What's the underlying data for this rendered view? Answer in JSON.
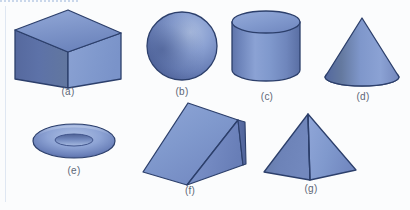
{
  "figure": {
    "background_color": "#fbfcfd",
    "outline_color": "#2c3f6b",
    "base_fill_color": "#7a93cc",
    "label_color": "#5c6676",
    "shapes": [
      {
        "id": "cube",
        "name": "cube",
        "label": "(a)",
        "label_x": 68,
        "label_y": 92,
        "faces": [
          "top",
          "left",
          "right"
        ]
      },
      {
        "id": "sphere",
        "name": "sphere",
        "label": "(b)",
        "label_x": 182,
        "label_y": 92,
        "faces": [
          "surface"
        ]
      },
      {
        "id": "cylinder",
        "name": "cylinder",
        "label": "(c)",
        "label_x": 267,
        "label_y": 97,
        "faces": [
          "top-ellipse",
          "body"
        ]
      },
      {
        "id": "cone",
        "name": "cone",
        "label": "(d)",
        "label_x": 363,
        "label_y": 97,
        "faces": [
          "lateral",
          "base-ellipse"
        ]
      },
      {
        "id": "torus",
        "name": "torus",
        "label": "(e)",
        "label_x": 74,
        "label_y": 172,
        "faces": [
          "ring"
        ]
      },
      {
        "id": "wedge",
        "name": "triangular-prism-wedge",
        "label": "(f)",
        "label_x": 190,
        "label_y": 192,
        "faces": [
          "slant-top",
          "front-triangle",
          "right-side"
        ]
      },
      {
        "id": "pyramid",
        "name": "square-pyramid",
        "label": "(g)",
        "label_x": 310,
        "label_y": 190,
        "faces": [
          "left-face",
          "right-face"
        ]
      }
    ],
    "palette": {
      "light_blue": "#9fb4de",
      "mid_blue": "#7d95c9",
      "deep_blue": "#53689f",
      "shadow_blue": "#3f5488",
      "outline": "#2c3f6b",
      "highlight": "#b9c9e8"
    },
    "rules": {
      "left_margin": "vertical rule",
      "bottom_dotted": "dotted rule"
    }
  }
}
